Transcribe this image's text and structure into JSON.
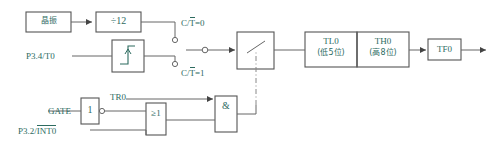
{
  "diagram": {
    "accent_color": "#2d6b5f",
    "line_color": "#555555",
    "box_border_color": "#555555"
  },
  "blocks": {
    "oscillator": {
      "label": "晶振"
    },
    "divider": {
      "label": "÷12"
    },
    "edge_detect": {
      "label": ""
    },
    "switch": {
      "label": ""
    },
    "tl0": {
      "label": "TL0",
      "sub": "(低5位)"
    },
    "th0": {
      "label": "TH0",
      "sub": "(高8位)"
    },
    "tf0": {
      "label": "TF0"
    },
    "inverter": {
      "label": "1"
    },
    "or_gate": {
      "label": "≥1"
    },
    "and_gate": {
      "label": "&"
    }
  },
  "signals": {
    "t0_pin": "P3.4/T0",
    "int0_pin_prefix": "P3.2/",
    "int0_pin_bar": "INT0",
    "gate": "GATE",
    "tr0": "TR0",
    "ct_prefix": "C/",
    "ct_bar": "T",
    "ct_zero_suffix": "=0",
    "ct_one_suffix": "=1"
  }
}
